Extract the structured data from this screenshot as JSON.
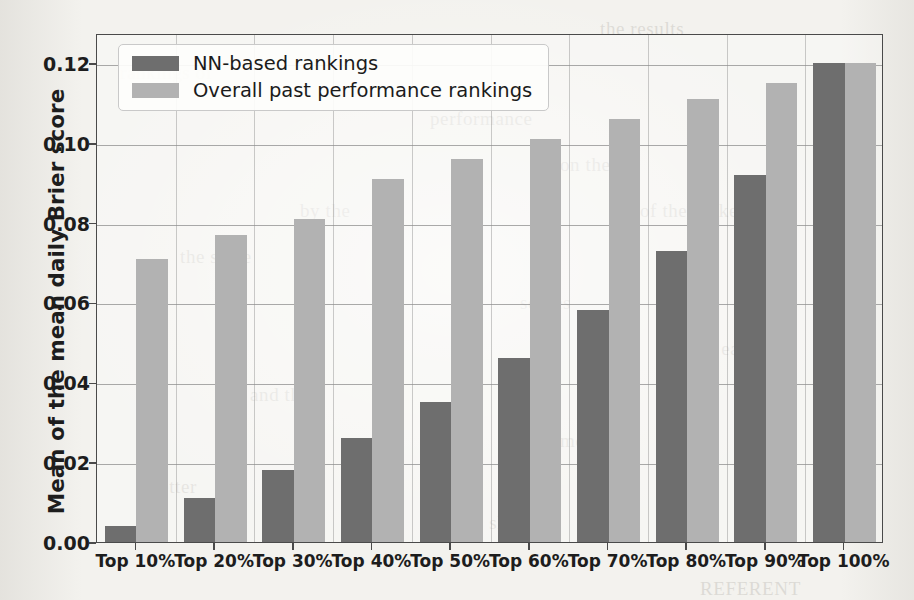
{
  "chart_data": {
    "type": "bar",
    "title": "",
    "subtitle": "",
    "xlabel": "",
    "ylabel": "Mean of the mean daily Brier score",
    "categories": [
      "Top 10%",
      "Top 20%",
      "Top 30%",
      "Top 40%",
      "Top 50%",
      "Top 60%",
      "Top 70%",
      "Top 80%",
      "Top 90%",
      "Top 100%"
    ],
    "series": [
      {
        "name": "NN-based rankings",
        "color": "#6e6e6e",
        "values": [
          0.004,
          0.011,
          0.018,
          0.026,
          0.035,
          0.046,
          0.058,
          0.073,
          0.092,
          0.12
        ]
      },
      {
        "name": "Overall past performance rankings",
        "color": "#b2b2b2",
        "values": [
          0.071,
          0.077,
          0.081,
          0.091,
          0.096,
          0.101,
          0.106,
          0.111,
          0.115,
          0.12
        ]
      }
    ],
    "ylim": [
      0.0,
      0.1275
    ],
    "yticks": [
      0.0,
      0.02,
      0.04,
      0.06,
      0.08,
      0.1,
      0.12
    ],
    "ytick_labels": [
      "0.00",
      "0.02",
      "0.04",
      "0.06",
      "0.08",
      "0.10",
      "0.12"
    ],
    "grid": "horizontal-and-vertical",
    "legend_position": "upper left"
  },
  "legend": {
    "entries": [
      {
        "label": "NN-based rankings",
        "swatch": "dark-grey-swatch"
      },
      {
        "label": "Overall past performance rankings",
        "swatch": "light-grey-swatch"
      }
    ]
  },
  "scan_bleed": [
    {
      "text": "the results",
      "x": 600,
      "y": 6
    },
    {
      "text": "rankings of",
      "x": 120,
      "y": 50
    },
    {
      "text": "performance",
      "x": 430,
      "y": 96
    },
    {
      "text": "on the",
      "x": 560,
      "y": 142
    },
    {
      "text": "by the",
      "x": 300,
      "y": 188
    },
    {
      "text": "of the ranked",
      "x": 640,
      "y": 188
    },
    {
      "text": "the same",
      "x": 180,
      "y": 234
    },
    {
      "text": "scores",
      "x": 520,
      "y": 280
    },
    {
      "text": "in each",
      "x": 700,
      "y": 326
    },
    {
      "text": "and the",
      "x": 250,
      "y": 372
    },
    {
      "text": "models",
      "x": 560,
      "y": 418
    },
    {
      "text": "better",
      "x": 150,
      "y": 464
    },
    {
      "text": "is shown",
      "x": 470,
      "y": 500
    },
    {
      "text": "REFERENT",
      "x": 700,
      "y": 566
    }
  ]
}
